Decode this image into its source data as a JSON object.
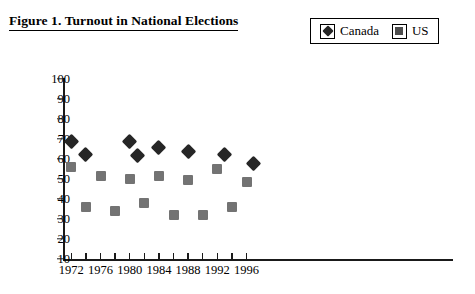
{
  "figure": {
    "title": "Figure 1. Turnout in National Elections"
  },
  "legend": {
    "position": "top-right",
    "entries": [
      {
        "label": "Canada",
        "marker": "diamond-icon",
        "color": "#262626"
      },
      {
        "label": "US",
        "marker": "square-icon",
        "color": "#737373"
      }
    ]
  },
  "chart_data": {
    "type": "scatter",
    "title": "Figure 1. Turnout in National Elections",
    "xlabel": "",
    "ylabel": "",
    "xlim": [
      1971,
      1998
    ],
    "ylim": [
      10,
      100
    ],
    "ytick_labels": [
      "10",
      "20",
      "30",
      "40",
      "50",
      "60",
      "70",
      "80",
      "90",
      "100"
    ],
    "ytick_values": [
      10,
      20,
      30,
      40,
      50,
      60,
      70,
      80,
      90,
      100
    ],
    "xtick_labels": [
      "1972",
      "1976",
      "1980",
      "1984",
      "1988",
      "1992",
      "1996"
    ],
    "xtick_values": [
      1972,
      1976,
      1980,
      1984,
      1988,
      1992,
      1996
    ],
    "xminor_values": [
      1974,
      1978,
      1982,
      1986,
      1990,
      1994
    ],
    "grid": false,
    "legend_position": "top-right",
    "series": [
      {
        "name": "Canada",
        "marker": "diamond",
        "color": "#262626",
        "points": [
          {
            "x": 1972,
            "y": 69
          },
          {
            "x": 1974,
            "y": 62.5
          },
          {
            "x": 1980,
            "y": 69
          },
          {
            "x": 1981,
            "y": 62
          },
          {
            "x": 1984,
            "y": 66
          },
          {
            "x": 1988,
            "y": 64
          },
          {
            "x": 1993,
            "y": 62.5
          },
          {
            "x": 1997,
            "y": 58
          }
        ]
      },
      {
        "name": "US",
        "marker": "square",
        "color": "#737373",
        "points": [
          {
            "x": 1972,
            "y": 56
          },
          {
            "x": 1974,
            "y": 36
          },
          {
            "x": 1976,
            "y": 51.5
          },
          {
            "x": 1978,
            "y": 34
          },
          {
            "x": 1980,
            "y": 50
          },
          {
            "x": 1982,
            "y": 38
          },
          {
            "x": 1984,
            "y": 51.5
          },
          {
            "x": 1986,
            "y": 32
          },
          {
            "x": 1988,
            "y": 49.5
          },
          {
            "x": 1990,
            "y": 32
          },
          {
            "x": 1992,
            "y": 55
          },
          {
            "x": 1994,
            "y": 36
          },
          {
            "x": 1996,
            "y": 48.5
          }
        ]
      }
    ]
  }
}
